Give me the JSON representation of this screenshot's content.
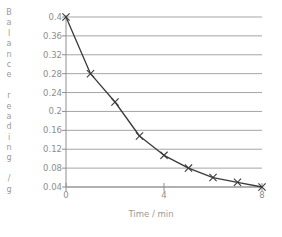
{
  "chart_data": {
    "type": "line",
    "title": "",
    "xlabel": "Time / min",
    "ylabel": "Balance reading / g",
    "ylabel_chars": [
      "B",
      "a",
      "l",
      "a",
      "n",
      "c",
      "e",
      "",
      "r",
      "e",
      "a",
      "d",
      "i",
      "n",
      "g",
      "",
      "/",
      "g"
    ],
    "x": [
      0,
      1,
      2,
      3,
      4,
      5,
      6,
      7,
      8
    ],
    "values": [
      0.4,
      0.28,
      0.22,
      0.148,
      0.107,
      0.08,
      0.06,
      0.05,
      0.04
    ],
    "series": [
      {
        "name": "Balance reading",
        "values": [
          0.4,
          0.28,
          0.22,
          0.148,
          0.107,
          0.08,
          0.06,
          0.05,
          0.04
        ]
      }
    ],
    "xlim": [
      0,
      8
    ],
    "ylim": [
      0.04,
      0.4
    ],
    "xticks": [
      0,
      1,
      2,
      3,
      4,
      5,
      6,
      7,
      8
    ],
    "xtick_labels_shown": [
      {
        "value": 0,
        "label": "0"
      },
      {
        "value": 4,
        "label": "4"
      },
      {
        "value": 8,
        "label": "8"
      }
    ],
    "yticks": [
      0.04,
      0.08,
      0.12,
      0.16,
      0.2,
      0.24,
      0.28,
      0.32,
      0.36,
      0.4
    ],
    "ytick_labels": [
      "0.04",
      "0.08",
      "0.12",
      "0.16",
      "0.2",
      "0.24",
      "0.28",
      "0.32",
      "0.36",
      "0.4"
    ],
    "grid": true,
    "grid_axis": "y",
    "legend": false,
    "legend_position": "none",
    "marker": "x",
    "colors": {
      "line": "#3a3a3a",
      "marker": "#3a3a3a",
      "grid": "#9b9b9b",
      "axis": "#8e8e8e",
      "text": "#8e8e8e",
      "background": "#ffffff"
    }
  }
}
